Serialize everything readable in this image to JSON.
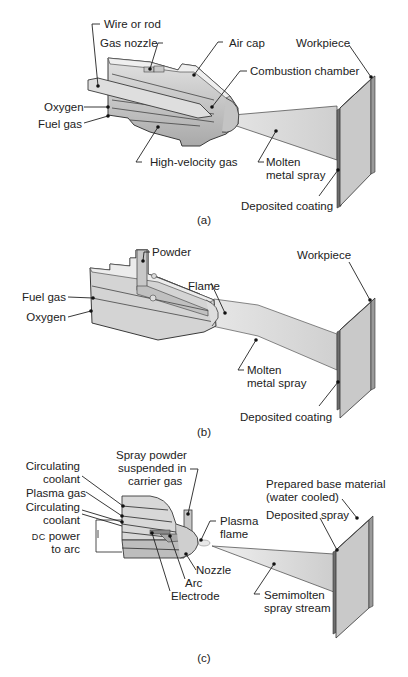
{
  "figure": {
    "panels": [
      {
        "id": "a",
        "caption": "(a)",
        "process": "Wire/rod flame spray",
        "labels": {
          "wire_or_rod": "Wire or rod",
          "gas_nozzle": "Gas nozzle",
          "air_cap": "Air cap",
          "workpiece": "Workpiece",
          "combustion_chamber": "Combustion chamber",
          "oxygen": "Oxygen",
          "fuel_gas": "Fuel gas",
          "high_velocity_gas": "High-velocity gas",
          "molten_line1": "Molten",
          "molten_line2": "metal spray",
          "deposited_coating": "Deposited coating"
        }
      },
      {
        "id": "b",
        "caption": "(b)",
        "process": "Powder flame spray",
        "labels": {
          "powder": "Powder",
          "workpiece": "Workpiece",
          "fuel_gas": "Fuel gas",
          "flame": "Flame",
          "oxygen": "Oxygen",
          "molten_line1": "Molten",
          "molten_line2": "metal spray",
          "deposited_coating": "Deposited coating"
        }
      },
      {
        "id": "c",
        "caption": "(c)",
        "process": "Plasma arc spray",
        "labels": {
          "spray_powder_line1": "Spray powder",
          "spray_powder_line2": "suspended in",
          "spray_powder_line3": "carrier gas",
          "circ_coolant1_line1": "Circulating",
          "circ_coolant1_line2": "coolant",
          "plasma_gas": "Plasma gas",
          "circ_coolant2_line1": "Circulating",
          "circ_coolant2_line2": "coolant",
          "dc_prefix": "DC",
          "dc_power_suffix": " power",
          "dc_power_line2": "to arc",
          "prepared_line1": "Prepared base material",
          "prepared_line2": "(water cooled)",
          "deposited_spray": "Deposited spray",
          "plasma_flame_line1": "Plasma",
          "plasma_flame_line2": "flame",
          "nozzle": "Nozzle",
          "arc": "Arc",
          "electrode": "Electrode",
          "stream_line1": "Semimolten",
          "stream_line2": "spray stream"
        }
      }
    ],
    "colors": {
      "body_light": "#dcdcdc",
      "body_mid": "#b8b8b8",
      "body_dark": "#8e8e8e",
      "outline": "#3a3a3a",
      "plate_face": "#c9c9c9",
      "coating": "#6e6e6e",
      "spray": "#d6d6d6"
    }
  }
}
